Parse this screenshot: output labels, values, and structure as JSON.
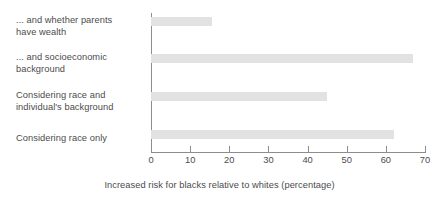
{
  "chart_data": {
    "type": "bar",
    "orientation": "horizontal",
    "title": "",
    "subtitle": "",
    "xlabel": "Increased risk for blacks relative to whites (percentage)",
    "ylabel": "",
    "categories": [
      "... and whether parents have wealth",
      "... and socioeconomic background",
      "Considering race and individual's background",
      "Considering race only"
    ],
    "values": [
      15.5,
      67,
      45,
      62
    ],
    "xlim": [
      0,
      70
    ],
    "xticks": [
      0,
      10,
      20,
      30,
      40,
      50,
      60,
      70
    ],
    "xtick_labels": [
      "0",
      "10",
      "20",
      "30",
      "40",
      "50",
      "60",
      "70"
    ],
    "grid": false,
    "legend": null,
    "bar_color": "#e2e2e2",
    "axis_color": "#8d8d8d",
    "text_color": "#4c4c4c"
  },
  "labels": {
    "cat0_line1": "... and whether parents",
    "cat0_line2": "have wealth",
    "cat1_line1": "... and socioeconomic",
    "cat1_line2": "background",
    "cat2_line1": "Considering race and",
    "cat2_line2": "individual's background",
    "cat3_line1": "Considering race only"
  }
}
